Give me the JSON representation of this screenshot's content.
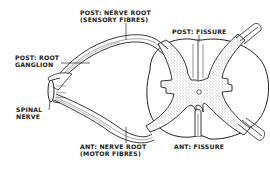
{
  "diagram": {
    "colors": {
      "ink": "#222222",
      "background": "#ffffff",
      "grey_matter_stipple": "#555555"
    },
    "labels": {
      "post_nerve_root_line1": "POST: NERVE ROOT",
      "post_nerve_root_line2": "(SENSORY FIBRES)",
      "post_fissure": "POST: FISSURE",
      "post_root_ganglion_line1": "POST: ROOT",
      "post_root_ganglion_line2": "GANGLION",
      "spinal_nerve_line1": "SPINAL",
      "spinal_nerve_line2": "NERVE",
      "ant_nerve_root_line1": "ANT: NERVE ROOT",
      "ant_nerve_root_line2": "(MOTOR FIBRES)",
      "ant_fissure": "ANT: FISSURE"
    },
    "nodes": [
      {
        "id": "spinal-nerve",
        "label": "SPINAL NERVE"
      },
      {
        "id": "post-root-ganglion",
        "label": "POST: ROOT GANGLION"
      },
      {
        "id": "post-nerve-root",
        "label": "POST: NERVE ROOT (SENSORY FIBRES)"
      },
      {
        "id": "ant-nerve-root",
        "label": "ANT: NERVE ROOT (MOTOR FIBRES)"
      },
      {
        "id": "spinal-cord",
        "label": ""
      },
      {
        "id": "post-fissure",
        "label": "POST: FISSURE"
      },
      {
        "id": "ant-fissure",
        "label": "ANT: FISSURE"
      }
    ],
    "edges": [
      {
        "from": "spinal-nerve",
        "to": "post-root-ganglion"
      },
      {
        "from": "post-root-ganglion",
        "to": "post-nerve-root"
      },
      {
        "from": "post-nerve-root",
        "to": "spinal-cord"
      },
      {
        "from": "spinal-nerve",
        "to": "ant-nerve-root"
      },
      {
        "from": "ant-nerve-root",
        "to": "spinal-cord"
      }
    ]
  }
}
